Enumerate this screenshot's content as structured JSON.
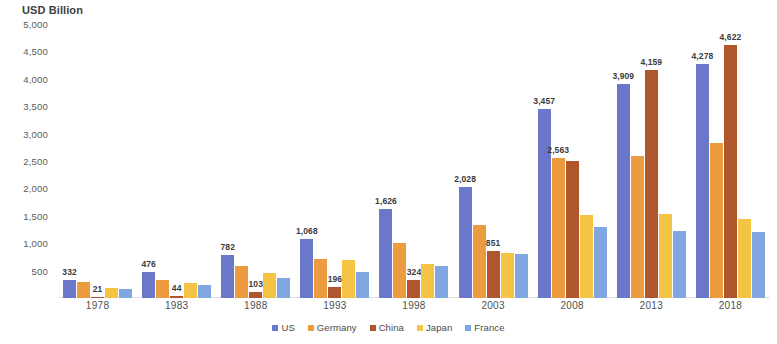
{
  "axis_title": "USD Billion",
  "legend": {
    "items": [
      {
        "label": "US",
        "color": "#6b77c9"
      },
      {
        "label": "Germany",
        "color": "#ec9c3f"
      },
      {
        "label": "China",
        "color": "#b0562c"
      },
      {
        "label": "Japan",
        "color": "#f6c445"
      },
      {
        "label": "France",
        "color": "#81a7e0"
      }
    ]
  },
  "chart_data": {
    "type": "bar",
    "title": "",
    "subtitle": "",
    "xlabel": "",
    "ylabel": "USD Billion",
    "ylim": [
      0,
      5000
    ],
    "ytick_labels": [
      "5,000",
      "4,500",
      "4,000",
      "3,500",
      "3,000",
      "2,500",
      "2,000",
      "1,500",
      "1,000",
      "500",
      ""
    ],
    "ytick_values": [
      5000,
      4500,
      4000,
      3500,
      3000,
      2500,
      2000,
      1500,
      1000,
      500,
      0
    ],
    "grid": false,
    "legend_position": "bottom",
    "categories": [
      "1978",
      "1983",
      "1988",
      "1993",
      "1998",
      "2003",
      "2008",
      "2013",
      "2018"
    ],
    "series": [
      {
        "name": "US",
        "color": "#6b77c9",
        "values": [
          332,
          476,
          782,
          1068,
          1626,
          2028,
          3457,
          3909,
          4278
        ],
        "labels": [
          "332",
          "476",
          "782",
          "1,068",
          "1,626",
          "2,028",
          "3,457",
          "3,909",
          "4,278"
        ]
      },
      {
        "name": "Germany",
        "color": "#ec9c3f",
        "values": [
          285,
          320,
          580,
          710,
          1000,
          1340,
          2563,
          2600,
          2820
        ],
        "labels": [
          "",
          "",
          "",
          "",
          "",
          "",
          "2,563",
          "",
          ""
        ]
      },
      {
        "name": "China",
        "color": "#b0562c",
        "values": [
          21,
          44,
          103,
          196,
          324,
          851,
          2500,
          4159,
          4622
        ],
        "labels": [
          "21",
          "44",
          "103",
          "196",
          "324",
          "851",
          "",
          "4,159",
          "4,622"
        ]
      },
      {
        "name": "Japan",
        "color": "#f6c445",
        "values": [
          190,
          280,
          460,
          700,
          620,
          830,
          1520,
          1530,
          1450
        ],
        "labels": [
          "",
          "",
          "",
          "",
          "",
          "",
          "",
          "",
          ""
        ]
      },
      {
        "name": "France",
        "color": "#81a7e0",
        "values": [
          165,
          240,
          360,
          480,
          580,
          810,
          1300,
          1230,
          1200
        ],
        "labels": [
          "",
          "",
          "",
          "",
          "",
          "",
          "",
          "",
          ""
        ]
      }
    ]
  }
}
